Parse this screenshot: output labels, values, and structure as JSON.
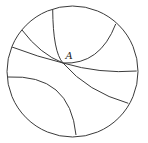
{
  "diagram": {
    "type": "poincare-disk",
    "background": "#ffffff",
    "stroke_color": "#3a3a3a",
    "disk": {
      "cx": 72.5,
      "cy": 71.5,
      "r": 65.5
    },
    "point": {
      "label": "A",
      "x": 63,
      "y": 63,
      "label_x": 65.5,
      "label_y": 58.5
    },
    "geodesics": [
      {
        "name": "geodesic-top-to-lower-right",
        "through_A": true,
        "d": "M 52.7 9.3 Q 53 52 63 63 Q 88 92 128.3 103.3"
      },
      {
        "name": "geodesic-upper-left-to-upper-right",
        "through_A": true,
        "d": "M 22 30 Q 40 54 63 63 Q 100 65 115.7 24"
      },
      {
        "name": "geodesic-mid-left-to-right",
        "through_A": true,
        "d": "M 12 47 Q 38 57 63 63 Q 100 74 136.7 71"
      },
      {
        "name": "geodesic-left-to-bottom",
        "through_A": false,
        "d": "M 8 77 Q 70 74 76 135"
      }
    ]
  }
}
